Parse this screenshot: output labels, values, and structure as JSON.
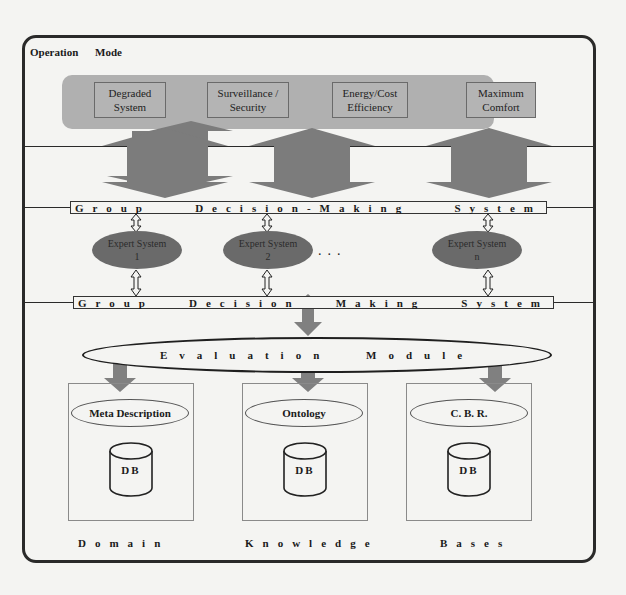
{
  "diagram": {
    "title": "Operation Mode",
    "operation_modes": [
      {
        "label_line1": "Degraded",
        "label_line2": "System"
      },
      {
        "label_line1": "Surveillance /",
        "label_line2": "Security"
      },
      {
        "label_line1": "Energy/Cost",
        "label_line2": "Efficiency"
      },
      {
        "label_line1": "Maximum",
        "label_line2": "Comfort"
      }
    ],
    "group_decision_top": {
      "words": [
        "Group",
        "Decision-Making",
        "System"
      ]
    },
    "expert_systems": [
      {
        "label": "Expert System",
        "index": "1"
      },
      {
        "label": "Expert System",
        "index": "2"
      },
      {
        "label": "Expert System",
        "index": "n"
      }
    ],
    "ellipsis": "...",
    "group_decision_bottom": {
      "words": [
        "Group",
        "Decision",
        "Making",
        "System"
      ]
    },
    "evaluation_module": "Evaluation Module",
    "knowledge_bases": [
      {
        "component": "Meta Description",
        "db": "DB"
      },
      {
        "component": "Ontology",
        "db": "DB"
      },
      {
        "component": "C. B. R.",
        "db": "DB"
      }
    ],
    "footer_words": [
      "Domain",
      "Knowledge",
      "Bases"
    ],
    "colors": {
      "band": "#b0b0b0",
      "arrow": "#7a7a7a",
      "expert_fill": "#6a6a6a",
      "outline": "#2a2a2a"
    }
  }
}
